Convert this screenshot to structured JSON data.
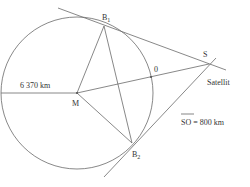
{
  "diagram": {
    "type": "geometry",
    "colors": {
      "line": "#6a6a6a",
      "text": "#333333",
      "background": "#ffffff"
    },
    "points": {
      "M": {
        "label": "M",
        "x": 77,
        "y": 93
      },
      "B1": {
        "label": "B",
        "sub": "1",
        "x": 104,
        "y": 26
      },
      "B2": {
        "label": "B",
        "sub": "2",
        "x": 132,
        "y": 143
      },
      "O": {
        "label": "0",
        "x": 151,
        "y": 77
      },
      "S": {
        "label": "S",
        "x": 209,
        "y": 64
      }
    },
    "circle": {
      "cx": 77,
      "cy": 93,
      "r": 76
    },
    "labels": {
      "radius": "6 370 km",
      "satellite": "Satellit",
      "so_distance_left": "SO",
      "so_distance_right": " = 800 km"
    }
  }
}
